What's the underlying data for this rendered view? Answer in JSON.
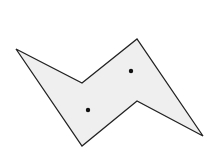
{
  "diagram": {
    "width": 216,
    "height": 152,
    "background": "#ffffff",
    "polygon": {
      "points": "16,49 82,83 137,39 203,136 137,101 82,146",
      "fill": "#efefef",
      "stroke": "#222222",
      "stroke_width": 1.3
    },
    "dots": [
      {
        "cx": 131,
        "cy": 71,
        "r": 2.2,
        "fill": "#111111"
      },
      {
        "cx": 88,
        "cy": 110,
        "r": 2.2,
        "fill": "#111111"
      }
    ]
  }
}
